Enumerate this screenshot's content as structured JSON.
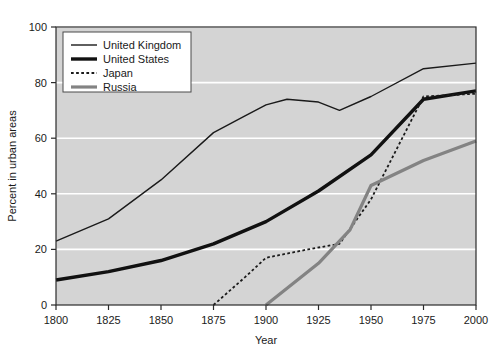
{
  "chart_data": {
    "type": "line",
    "title": "",
    "xlabel": "Year",
    "ylabel": "Percent in urban areas",
    "xlim": [
      1800,
      2000
    ],
    "ylim": [
      0,
      100
    ],
    "xticks": [
      1800,
      1825,
      1850,
      1875,
      1900,
      1925,
      1950,
      1975,
      2000
    ],
    "yticks": [
      0,
      20,
      40,
      60,
      80,
      100
    ],
    "grid": "horizontal",
    "legend_position": "top-left",
    "plot_background": "#d4d4d4",
    "gridline_color": "#ffffff",
    "series": [
      {
        "name": "United Kingdom",
        "style": "solid-thin",
        "color": "#1a1a1a",
        "width": 1.4,
        "x": [
          1800,
          1825,
          1850,
          1875,
          1890,
          1900,
          1910,
          1925,
          1935,
          1950,
          1975,
          2000
        ],
        "values": [
          23,
          31,
          45,
          62,
          68,
          72,
          74,
          73,
          70,
          75,
          85,
          87
        ]
      },
      {
        "name": "United States",
        "style": "solid-thick",
        "color": "#111111",
        "width": 3.4,
        "x": [
          1800,
          1825,
          1850,
          1875,
          1900,
          1925,
          1950,
          1975,
          2000
        ],
        "values": [
          9,
          12,
          16,
          22,
          30,
          41,
          54,
          74,
          77
        ]
      },
      {
        "name": "Japan",
        "style": "dashed",
        "color": "#1a1a1a",
        "width": 1.8,
        "x": [
          1875,
          1890,
          1900,
          1920,
          1935,
          1950,
          1975,
          2000
        ],
        "values": [
          0,
          10,
          17,
          20,
          22,
          38,
          75,
          76
        ]
      },
      {
        "name": "Russia",
        "style": "solid-thick-gray",
        "color": "#838383",
        "width": 3.2,
        "x": [
          1900,
          1925,
          1940,
          1950,
          1975,
          2000
        ],
        "values": [
          0,
          15,
          27,
          43,
          52,
          59
        ]
      }
    ]
  },
  "axes": {
    "y_tick_labels": [
      "0",
      "20",
      "40",
      "60",
      "80",
      "100"
    ],
    "x_tick_labels": [
      "1800",
      "1825",
      "1850",
      "1875",
      "1900",
      "1925",
      "1950",
      "1975",
      "2000"
    ],
    "x_title": "Year",
    "y_title": "Percent in urban areas"
  },
  "legend": {
    "entries": [
      {
        "label": "United Kingdom"
      },
      {
        "label": "United States"
      },
      {
        "label": "Japan"
      },
      {
        "label": "Russia"
      }
    ]
  }
}
